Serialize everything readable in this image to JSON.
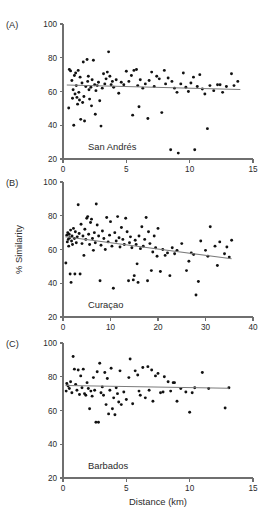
{
  "figure": {
    "ylabel": "% Similarity",
    "xlabel": "Distance (km)"
  },
  "chart_data": [
    {
      "type": "scatter",
      "panel": "(A)",
      "title": "San Andrés",
      "xlabel": "",
      "ylabel": "% Similarity",
      "xlim": [
        0,
        15
      ],
      "ylim": [
        20,
        100
      ],
      "xticks": [
        0,
        5,
        10,
        15
      ],
      "yticks": [
        20,
        40,
        60,
        80,
        100
      ],
      "grid": false,
      "legend": "none",
      "trendline": {
        "x": [
          0.3,
          14.0
        ],
        "y": [
          63.8,
          61.2
        ]
      },
      "points": [
        [
          0.45,
          50.2
        ],
        [
          0.5,
          73.0
        ],
        [
          0.6,
          72.2
        ],
        [
          0.7,
          66.5
        ],
        [
          0.75,
          56.0
        ],
        [
          0.8,
          61.0
        ],
        [
          0.85,
          40.0
        ],
        [
          0.9,
          69.5
        ],
        [
          0.95,
          58.5
        ],
        [
          1.0,
          71.0
        ],
        [
          1.05,
          63.5
        ],
        [
          1.1,
          56.5
        ],
        [
          1.15,
          52.5
        ],
        [
          1.2,
          72.5
        ],
        [
          1.25,
          59.5
        ],
        [
          1.3,
          55.0
        ],
        [
          1.35,
          68.5
        ],
        [
          1.4,
          43.5
        ],
        [
          1.5,
          65.0
        ],
        [
          1.55,
          53.5
        ],
        [
          1.6,
          77.5
        ],
        [
          1.65,
          57.0
        ],
        [
          1.7,
          42.5
        ],
        [
          1.8,
          63.0
        ],
        [
          1.9,
          79.0
        ],
        [
          1.95,
          66.0
        ],
        [
          2.0,
          69.0
        ],
        [
          2.05,
          61.0
        ],
        [
          2.1,
          55.5
        ],
        [
          2.2,
          62.5
        ],
        [
          2.25,
          51.5
        ],
        [
          2.3,
          67.0
        ],
        [
          2.4,
          78.5
        ],
        [
          2.5,
          64.0
        ],
        [
          2.55,
          46.5
        ],
        [
          2.6,
          60.5
        ],
        [
          2.7,
          63.5
        ],
        [
          2.8,
          65.5
        ],
        [
          2.9,
          54.5
        ],
        [
          3.0,
          39.5
        ],
        [
          3.1,
          62.0
        ],
        [
          3.2,
          70.5
        ],
        [
          3.3,
          64.5
        ],
        [
          3.4,
          67.5
        ],
        [
          3.5,
          71.5
        ],
        [
          3.6,
          83.5
        ],
        [
          3.7,
          69.0
        ],
        [
          3.8,
          64.0
        ],
        [
          3.9,
          66.0
        ],
        [
          4.0,
          62.5
        ],
        [
          4.2,
          67.0
        ],
        [
          4.4,
          59.0
        ],
        [
          4.6,
          65.5
        ],
        [
          4.8,
          64.0
        ],
        [
          5.0,
          72.0
        ],
        [
          5.2,
          66.0
        ],
        [
          5.4,
          69.5
        ],
        [
          5.5,
          46.0
        ],
        [
          5.6,
          72.5
        ],
        [
          5.8,
          73.0
        ],
        [
          5.9,
          63.5
        ],
        [
          6.0,
          51.0
        ],
        [
          6.1,
          67.0
        ],
        [
          6.3,
          62.0
        ],
        [
          6.5,
          64.5
        ],
        [
          6.7,
          44.0
        ],
        [
          6.8,
          66.5
        ],
        [
          7.0,
          71.5
        ],
        [
          7.2,
          63.0
        ],
        [
          7.4,
          69.0
        ],
        [
          7.6,
          67.5
        ],
        [
          7.8,
          47.5
        ],
        [
          8.0,
          72.5
        ],
        [
          8.1,
          64.5
        ],
        [
          8.3,
          68.0
        ],
        [
          8.5,
          25.5
        ],
        [
          8.6,
          66.0
        ],
        [
          8.8,
          62.0
        ],
        [
          9.0,
          59.5
        ],
        [
          9.1,
          23.5
        ],
        [
          9.3,
          64.5
        ],
        [
          9.5,
          71.0
        ],
        [
          9.7,
          62.5
        ],
        [
          9.9,
          60.0
        ],
        [
          10.1,
          65.0
        ],
        [
          10.3,
          68.5
        ],
        [
          10.4,
          25.5
        ],
        [
          10.6,
          63.0
        ],
        [
          10.8,
          70.0
        ],
        [
          11.0,
          61.5
        ],
        [
          11.2,
          58.5
        ],
        [
          11.4,
          38.0
        ],
        [
          11.6,
          63.5
        ],
        [
          11.9,
          60.5
        ],
        [
          12.2,
          64.0
        ],
        [
          12.4,
          64.0
        ],
        [
          12.6,
          59.5
        ],
        [
          12.9,
          63.0
        ],
        [
          13.3,
          70.5
        ],
        [
          13.5,
          63.5
        ],
        [
          13.8,
          66.0
        ]
      ]
    },
    {
      "type": "scatter",
      "panel": "(B)",
      "title": "Curaçao",
      "xlabel": "",
      "ylabel": "% Similarity",
      "xlim": [
        0,
        40
      ],
      "ylim": [
        20,
        100
      ],
      "xticks": [
        0,
        10,
        20,
        30,
        40
      ],
      "yticks": [
        20,
        40,
        60,
        80,
        100
      ],
      "grid": false,
      "legend": "none",
      "trendline": {
        "x": [
          0.5,
          35.5
        ],
        "y": [
          67.5,
          54.5
        ]
      },
      "points": [
        [
          0.6,
          52.0
        ],
        [
          0.8,
          68.5
        ],
        [
          0.9,
          64.5
        ],
        [
          1.0,
          70.0
        ],
        [
          1.1,
          66.0
        ],
        [
          1.2,
          62.0
        ],
        [
          1.3,
          69.0
        ],
        [
          1.4,
          67.0
        ],
        [
          1.5,
          45.5
        ],
        [
          1.6,
          71.5
        ],
        [
          1.7,
          40.5
        ],
        [
          1.8,
          65.0
        ],
        [
          1.9,
          68.0
        ],
        [
          2.0,
          63.0
        ],
        [
          2.2,
          72.5
        ],
        [
          2.4,
          66.5
        ],
        [
          2.5,
          45.5
        ],
        [
          2.6,
          70.5
        ],
        [
          2.8,
          64.0
        ],
        [
          3.0,
          67.5
        ],
        [
          3.2,
          86.5
        ],
        [
          3.4,
          69.5
        ],
        [
          3.6,
          45.5
        ],
        [
          3.8,
          75.0
        ],
        [
          4.0,
          63.5
        ],
        [
          4.2,
          68.0
        ],
        [
          4.4,
          56.5
        ],
        [
          4.6,
          72.0
        ],
        [
          4.8,
          66.0
        ],
        [
          5.0,
          78.5
        ],
        [
          5.2,
          79.5
        ],
        [
          5.4,
          69.0
        ],
        [
          5.6,
          63.0
        ],
        [
          5.8,
          76.0
        ],
        [
          6.0,
          78.0
        ],
        [
          6.2,
          66.5
        ],
        [
          6.4,
          59.5
        ],
        [
          6.6,
          70.0
        ],
        [
          6.8,
          64.0
        ],
        [
          7.0,
          87.0
        ],
        [
          7.2,
          74.5
        ],
        [
          7.5,
          68.0
        ],
        [
          7.8,
          41.5
        ],
        [
          8.0,
          62.5
        ],
        [
          8.3,
          71.0
        ],
        [
          8.6,
          66.5
        ],
        [
          8.9,
          60.0
        ],
        [
          9.2,
          79.0
        ],
        [
          9.5,
          64.5
        ],
        [
          9.8,
          68.5
        ],
        [
          10.0,
          76.5
        ],
        [
          10.3,
          62.0
        ],
        [
          10.6,
          37.0
        ],
        [
          10.9,
          70.0
        ],
        [
          11.2,
          65.0
        ],
        [
          11.5,
          79.5
        ],
        [
          11.8,
          67.0
        ],
        [
          12.0,
          61.5
        ],
        [
          12.3,
          73.0
        ],
        [
          12.6,
          66.0
        ],
        [
          12.9,
          63.0
        ],
        [
          13.2,
          78.5
        ],
        [
          13.5,
          70.5
        ],
        [
          13.8,
          41.5
        ],
        [
          14.0,
          64.0
        ],
        [
          14.2,
          67.5
        ],
        [
          14.5,
          61.0
        ],
        [
          14.8,
          42.0
        ],
        [
          15.0,
          44.5
        ],
        [
          15.2,
          65.5
        ],
        [
          15.4,
          63.0
        ],
        [
          15.6,
          51.5
        ],
        [
          15.8,
          40.5
        ],
        [
          16.0,
          68.0
        ],
        [
          16.3,
          60.5
        ],
        [
          16.6,
          73.5
        ],
        [
          16.9,
          62.0
        ],
        [
          17.2,
          66.0
        ],
        [
          17.5,
          79.0
        ],
        [
          17.8,
          41.5
        ],
        [
          18.0,
          70.5
        ],
        [
          18.3,
          63.5
        ],
        [
          18.6,
          47.5
        ],
        [
          18.9,
          58.5
        ],
        [
          19.2,
          68.0
        ],
        [
          19.5,
          61.0
        ],
        [
          19.8,
          56.0
        ],
        [
          20.0,
          72.5
        ],
        [
          20.5,
          47.0
        ],
        [
          21.0,
          60.0
        ],
        [
          21.5,
          56.5
        ],
        [
          22.0,
          58.0
        ],
        [
          22.5,
          44.5
        ],
        [
          23.0,
          61.0
        ],
        [
          23.5,
          57.5
        ],
        [
          24.0,
          59.5
        ],
        [
          25.0,
          63.5
        ],
        [
          26.0,
          47.5
        ],
        [
          26.5,
          53.0
        ],
        [
          27.0,
          58.0
        ],
        [
          27.5,
          57.0
        ],
        [
          28.0,
          33.0
        ],
        [
          28.5,
          41.0
        ],
        [
          29.0,
          65.0
        ],
        [
          30.0,
          59.5
        ],
        [
          30.5,
          56.0
        ],
        [
          31.0,
          73.5
        ],
        [
          32.0,
          62.0
        ],
        [
          32.5,
          50.5
        ],
        [
          33.0,
          64.5
        ],
        [
          34.0,
          57.5
        ],
        [
          34.5,
          61.5
        ],
        [
          35.0,
          55.5
        ],
        [
          35.5,
          65.5
        ]
      ]
    },
    {
      "type": "scatter",
      "panel": "(C)",
      "title": "Barbados",
      "xlabel": "Distance (km)",
      "ylabel": "% Similarity",
      "xlim": [
        0,
        15
      ],
      "ylim": [
        20,
        100
      ],
      "xticks": [
        0,
        5,
        10,
        15
      ],
      "yticks": [
        20,
        40,
        60,
        80,
        100
      ],
      "grid": false,
      "legend": "none",
      "trendline": {
        "x": [
          0.2,
          13.1
        ],
        "y": [
          74.8,
          73.2
        ]
      },
      "points": [
        [
          0.25,
          71.5
        ],
        [
          0.3,
          76.0
        ],
        [
          0.4,
          74.5
        ],
        [
          0.5,
          73.0
        ],
        [
          0.6,
          77.0
        ],
        [
          0.7,
          70.5
        ],
        [
          0.8,
          92.0
        ],
        [
          0.9,
          84.5
        ],
        [
          1.0,
          75.5
        ],
        [
          1.1,
          72.0
        ],
        [
          1.2,
          84.0
        ],
        [
          1.3,
          69.5
        ],
        [
          1.4,
          80.5
        ],
        [
          1.5,
          73.5
        ],
        [
          1.6,
          84.5
        ],
        [
          1.7,
          70.0
        ],
        [
          1.8,
          69.0
        ],
        [
          1.9,
          76.5
        ],
        [
          2.0,
          73.0
        ],
        [
          2.1,
          61.0
        ],
        [
          2.2,
          71.5
        ],
        [
          2.3,
          68.5
        ],
        [
          2.4,
          79.5
        ],
        [
          2.5,
          72.0
        ],
        [
          2.6,
          53.0
        ],
        [
          2.7,
          83.0
        ],
        [
          2.8,
          53.0
        ],
        [
          2.9,
          88.0
        ],
        [
          3.0,
          70.5
        ],
        [
          3.1,
          74.0
        ],
        [
          3.2,
          69.0
        ],
        [
          3.3,
          82.5
        ],
        [
          3.4,
          63.5
        ],
        [
          3.5,
          79.0
        ],
        [
          3.6,
          58.0
        ],
        [
          3.7,
          72.0
        ],
        [
          3.8,
          85.0
        ],
        [
          3.9,
          61.0
        ],
        [
          4.0,
          67.5
        ],
        [
          4.1,
          57.5
        ],
        [
          4.2,
          73.5
        ],
        [
          4.3,
          70.0
        ],
        [
          4.4,
          65.0
        ],
        [
          4.5,
          83.5
        ],
        [
          4.6,
          63.5
        ],
        [
          4.8,
          71.0
        ],
        [
          5.0,
          66.5
        ],
        [
          5.2,
          79.5
        ],
        [
          5.3,
          90.5
        ],
        [
          5.5,
          64.0
        ],
        [
          5.7,
          83.5
        ],
        [
          5.9,
          81.0
        ],
        [
          6.0,
          71.5
        ],
        [
          6.1,
          69.0
        ],
        [
          6.3,
          85.5
        ],
        [
          6.5,
          67.5
        ],
        [
          6.7,
          86.0
        ],
        [
          6.8,
          72.0
        ],
        [
          7.0,
          84.0
        ],
        [
          7.1,
          65.5
        ],
        [
          7.3,
          80.5
        ],
        [
          7.5,
          82.0
        ],
        [
          7.7,
          70.5
        ],
        [
          7.9,
          71.0
        ],
        [
          8.0,
          80.0
        ],
        [
          8.3,
          77.0
        ],
        [
          8.5,
          71.5
        ],
        [
          8.7,
          76.5
        ],
        [
          8.8,
          76.5
        ],
        [
          9.0,
          65.5
        ],
        [
          9.3,
          73.0
        ],
        [
          9.7,
          71.0
        ],
        [
          10.0,
          59.0
        ],
        [
          10.2,
          70.5
        ],
        [
          10.4,
          73.5
        ],
        [
          11.0,
          82.5
        ],
        [
          11.5,
          73.0
        ],
        [
          12.8,
          61.5
        ],
        [
          13.1,
          73.5
        ]
      ]
    }
  ]
}
